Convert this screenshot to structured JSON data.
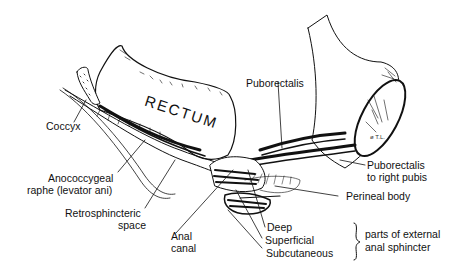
{
  "figure": {
    "type": "anatomical-illustration",
    "organ_label": "RECTUM",
    "signature": "ø T.L.",
    "labels": {
      "coccyx": "Coccyx",
      "puborectalis": "Puborectalis",
      "anococcygeal_1": "Anococcygeal",
      "anococcygeal_2": "raphe (levator ani)",
      "retrosphincteric_1": "Retrosphincteric",
      "retrosphincteric_2": "space",
      "anal_canal_1": "Anal",
      "anal_canal_2": "canal",
      "puborectalis_pubis_1": "Puborectalis",
      "puborectalis_pubis_2": "to right pubis",
      "perineal_body": "Perineal body",
      "deep": "Deep",
      "superficial": "Superficial",
      "subcutaneous": "Subcutaneous",
      "sphincter_group_1": "parts of external",
      "sphincter_group_2": "anal sphincter"
    },
    "colors": {
      "ink": "#111111",
      "background": "#ffffff"
    }
  }
}
